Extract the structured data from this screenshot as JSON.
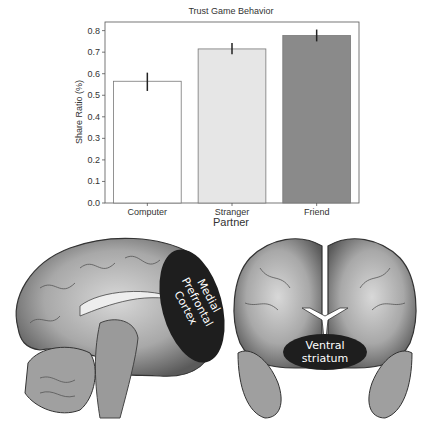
{
  "chart_data": {
    "type": "bar",
    "title": "Trust Game Behavior",
    "xlabel": "Partner",
    "ylabel": "Share Ratio (%)",
    "categories": [
      "Computer",
      "Stranger",
      "Friend"
    ],
    "values": [
      0.565,
      0.715,
      0.777
    ],
    "error_low": [
      0.52,
      0.69,
      0.75
    ],
    "error_high": [
      0.605,
      0.742,
      0.805
    ],
    "bar_colors": [
      "#ffffff",
      "#e6e6e6",
      "#8a8a8a"
    ],
    "ylim": [
      0.0,
      0.84
    ],
    "yticks": [
      "0.0",
      "0.1",
      "0.2",
      "0.3",
      "0.4",
      "0.5",
      "0.6",
      "0.7",
      "0.8"
    ],
    "grid": false,
    "legend": "none"
  },
  "brain_panels": {
    "sagittal": {
      "label_lines": [
        "Medial",
        "Prefrontal",
        "Cortex"
      ]
    },
    "coronal": {
      "label_lines": [
        "Ventral",
        "striatum"
      ]
    },
    "region_color": "#1e1e1e"
  }
}
